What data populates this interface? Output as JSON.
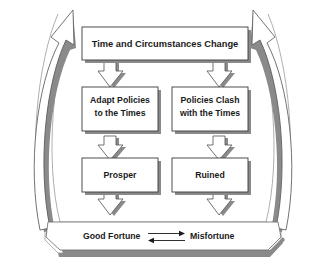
{
  "diagram": {
    "background_color": "#ffffff",
    "line_color": "#3a3a3a",
    "shadow_color": "#8a8a8a",
    "text_color": "#1a1a1a",
    "nodes": {
      "top": {
        "label": "Time and Circumstances Change",
        "lines": [
          "Time and Circumstances Change"
        ]
      },
      "left_mid": {
        "label": "Adapt Policies to the Times",
        "lines": [
          "Adapt Policies",
          "to the Times"
        ]
      },
      "right_mid": {
        "label": "Policies Clash with the Times",
        "lines": [
          "Policies Clash",
          "with the Times"
        ]
      },
      "left_bottom": {
        "label": "Prosper",
        "lines": [
          "Prosper"
        ]
      },
      "right_bottom": {
        "label": "Ruined",
        "lines": [
          "Ruined"
        ]
      }
    },
    "band": {
      "left_label": "Good Fortune",
      "right_label": "Misfortune",
      "connector_icon": "bidirectional-arrow-icon",
      "connector_description": "top arrow points right, bottom arrow points left"
    },
    "feedback_arrows": {
      "left": {
        "icon": "curved-feedback-arrow-up-right-icon",
        "description": "curved arrow from bottom band sweeping up the left side into the top box"
      },
      "right": {
        "icon": "curved-feedback-arrow-up-left-icon",
        "description": "curved arrow from bottom band sweeping up the right side into the top box"
      }
    },
    "connectors": [
      {
        "icon": "block-down-arrow-icon",
        "from": "top",
        "to": "left_mid"
      },
      {
        "icon": "block-down-arrow-icon",
        "from": "top",
        "to": "right_mid"
      },
      {
        "icon": "block-down-arrow-icon",
        "from": "left_mid",
        "to": "left_bottom"
      },
      {
        "icon": "block-down-arrow-icon",
        "from": "right_mid",
        "to": "right_bottom"
      },
      {
        "icon": "block-down-arrow-icon",
        "from": "left_bottom",
        "to": "band"
      },
      {
        "icon": "block-down-arrow-icon",
        "from": "right_bottom",
        "to": "band"
      }
    ]
  }
}
